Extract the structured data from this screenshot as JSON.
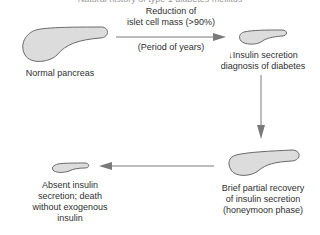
{
  "diagram": {
    "title": "Natural history of type 1 diabetes mellitus",
    "stages": [
      {
        "id": "normal",
        "label": [
          "Normal pancreas"
        ]
      },
      {
        "id": "diagnosis",
        "label": [
          "↓Insulin secretion",
          "diagnosis of diabetes"
        ]
      },
      {
        "id": "honeymoon",
        "label": [
          "Brief partial recovery",
          "of insulin secretion",
          "(honeymoon phase)"
        ]
      },
      {
        "id": "absent",
        "label": [
          "Absent insulin",
          "secretion; death",
          "without exogenous",
          "insulin"
        ]
      }
    ],
    "transitions": [
      {
        "from": "normal",
        "to": "diagnosis",
        "label_above": [
          "Reduction of",
          "islet cell mass (>90%)"
        ],
        "label_below": "(Period of years)"
      },
      {
        "from": "diagnosis",
        "to": "honeymoon"
      },
      {
        "from": "honeymoon",
        "to": "absent"
      }
    ],
    "colors": {
      "pancreas_fill": "#dcdcdc",
      "outline": "#6a6a6a",
      "arrow": "#7a7a7a",
      "text": "#2f2f2f"
    }
  }
}
